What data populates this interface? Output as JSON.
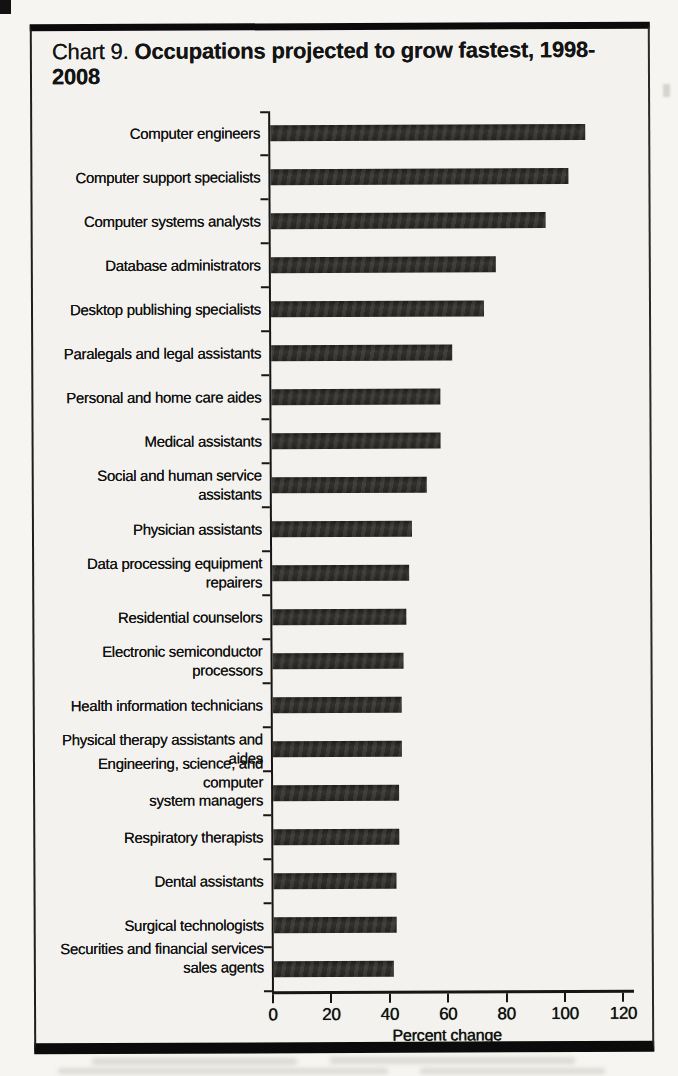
{
  "page": {
    "title_prefix": "Chart 9.",
    "title_main": "Occupations projected to grow fastest, 1998-2008"
  },
  "chart_data": {
    "type": "bar",
    "orientation": "horizontal",
    "title": "Chart 9. Occupations projected to grow fastest, 1998-2008",
    "xlabel": "Percent change",
    "xlim": [
      0,
      120
    ],
    "xticks": [
      0,
      20,
      40,
      60,
      80,
      100,
      120
    ],
    "grid": false,
    "legend": false,
    "bar_color": "#2a2826",
    "categories": [
      "Computer engineers",
      "Computer support specialists",
      "Computer systems analysts",
      "Database administrators",
      "Desktop publishing specialists",
      "Paralegals and legal assistants",
      "Personal and home care aides",
      "Medical assistants",
      "Social and human service assistants",
      "Physician assistants",
      "Data processing equipment repairers",
      "Residential counselors",
      "Electronic semiconductor processors",
      "Health information technicians",
      "Physical therapy assistants and aides",
      "Engineering, science, and computer\nsystem managers",
      "Respiratory therapists",
      "Dental assistants",
      "Surgical technologists",
      "Securities and financial services\nsales agents"
    ],
    "values": [
      108,
      102,
      94,
      77,
      73,
      62,
      58,
      58,
      53,
      48,
      47,
      46,
      45,
      44,
      44,
      43,
      43,
      42,
      42,
      41
    ]
  }
}
